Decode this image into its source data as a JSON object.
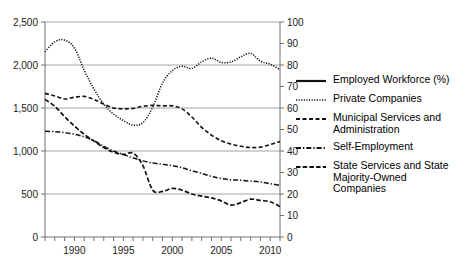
{
  "chart_data": {
    "type": "line",
    "title": "",
    "xlabel": "",
    "ylabel": "",
    "xlim": [
      1987,
      2011
    ],
    "ylim": [
      0,
      2500
    ],
    "y2lim": [
      0,
      100
    ],
    "grid": true,
    "legend_position": "right",
    "axis_left": {
      "ticks": [
        0,
        500,
        1000,
        1500,
        2000,
        2500
      ],
      "tick_labels": [
        "0",
        "500",
        "1,000",
        "1,500",
        "2,000",
        "2,500"
      ]
    },
    "axis_right": {
      "ticks": [
        0,
        10,
        20,
        30,
        40,
        50,
        60,
        70,
        80,
        90,
        100
      ],
      "tick_labels": [
        "0",
        "10",
        "20",
        "30",
        "40",
        "50",
        "60",
        "70",
        "80",
        "90",
        "100"
      ]
    },
    "axis_bottom": {
      "ticks": [
        1987,
        1988,
        1989,
        1990,
        1991,
        1992,
        1993,
        1994,
        1995,
        1996,
        1997,
        1998,
        1999,
        2000,
        2001,
        2002,
        2003,
        2004,
        2005,
        2006,
        2007,
        2008,
        2009,
        2010,
        2011
      ],
      "labeled_ticks": [
        1990,
        1995,
        2000,
        2005,
        2010
      ],
      "labeled_tick_labels": [
        "1990",
        "1995",
        "2000",
        "2005",
        "2010"
      ]
    },
    "x": [
      1987,
      1988,
      1989,
      1990,
      1991,
      1992,
      1993,
      1994,
      1995,
      1996,
      1997,
      1998,
      1999,
      2000,
      2001,
      2002,
      2003,
      2004,
      2005,
      2006,
      2007,
      2008,
      2009,
      2010,
      2011
    ],
    "series": [
      {
        "name": "Employed Workforce (%)",
        "axis": "right",
        "style": "solid",
        "values": [
          2125,
          2180,
          2200,
          2195,
          2130,
          2000,
          1890,
          1815,
          1765,
          1760,
          1775,
          1770,
          1765,
          1785,
          1845,
          1900,
          1925,
          1925,
          1920,
          1915,
          1925,
          1960,
          1985,
          2035,
          1985
        ]
      },
      {
        "name": "Private Companies",
        "axis": "left",
        "style": "dotted",
        "values": [
          2155,
          2270,
          2290,
          2200,
          1940,
          1720,
          1545,
          1430,
          1355,
          1300,
          1330,
          1510,
          1790,
          1935,
          1985,
          1960,
          2035,
          2080,
          2030,
          2035,
          2095,
          2135,
          2045,
          2010,
          1945
        ]
      },
      {
        "name": "Municipal Services and Administration",
        "axis": "left",
        "style": "dashed",
        "values": [
          1670,
          1640,
          1605,
          1625,
          1635,
          1600,
          1545,
          1500,
          1490,
          1495,
          1520,
          1530,
          1525,
          1525,
          1490,
          1395,
          1275,
          1185,
          1120,
          1080,
          1055,
          1040,
          1045,
          1075,
          1110
        ]
      },
      {
        "name": "Self-Employment",
        "axis": "left",
        "style": "dashdot",
        "values": [
          1230,
          1225,
          1215,
          1195,
          1165,
          1120,
          1055,
          1000,
          960,
          920,
          885,
          860,
          845,
          830,
          805,
          770,
          740,
          705,
          680,
          665,
          660,
          650,
          640,
          620,
          600
        ]
      },
      {
        "name": "State Services and State Majority-Owned Companies",
        "axis": "left",
        "style": "longdash",
        "values": [
          1600,
          1520,
          1400,
          1290,
          1195,
          1115,
          1040,
          985,
          960,
          975,
          830,
          545,
          530,
          565,
          545,
          500,
          475,
          455,
          420,
          370,
          400,
          440,
          425,
          410,
          355
        ]
      }
    ]
  },
  "legend": {
    "items": [
      {
        "label": "Employed Workforce (%)",
        "style": "solid"
      },
      {
        "label": "Private Companies",
        "style": "dotted"
      },
      {
        "label": "Municipal Services and\nAdministration",
        "style": "dashed"
      },
      {
        "label": "Self-Employment",
        "style": "dashdot"
      },
      {
        "label": "State Services and State\nMajority-Owned Companies",
        "style": "longdash"
      }
    ]
  },
  "colors": {
    "line": "#111111",
    "grid": "#9a9a9a",
    "axis": "#6f6f6f",
    "text": "#1a1a1a",
    "background": "#ffffff"
  }
}
